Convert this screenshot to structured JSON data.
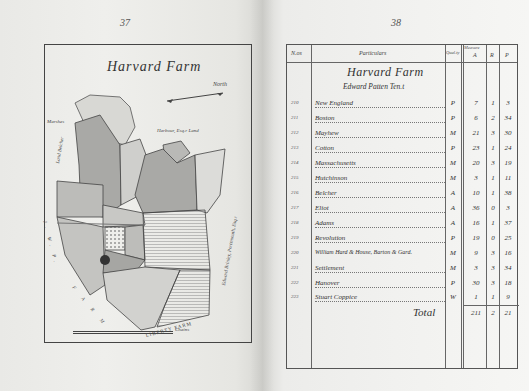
{
  "pages": {
    "left_number": "37",
    "right_number": "38"
  },
  "map": {
    "title": "Harvard Farm",
    "north_label": "North",
    "labels": {
      "top_right": "Harbour, Esq.r Land",
      "left_side": "Land Belcher",
      "left_vertical": "J. W. P.",
      "left_lower": "F A R M",
      "right_vertical": "Edward Brinley, Portsmouth, Esq.r",
      "bottom": "LIBERTY FARM",
      "far_left": "Marshes"
    },
    "scale_label": "Chains",
    "scale_ticks": [
      "0",
      "10",
      "20",
      "30"
    ]
  },
  "ledger": {
    "headers": {
      "no": "N.os",
      "particulars": "Particulars",
      "quality": "Qual.ty",
      "measure": "Measure",
      "a": "A",
      "r": "R",
      "p": "P"
    },
    "title": "Harvard Farm",
    "tenant": "Edward Patten Ten.t",
    "rows": [
      {
        "no": "210",
        "name": "New England",
        "q": "P",
        "a": "7",
        "r": "1",
        "p": "3"
      },
      {
        "no": "211",
        "name": "Boston",
        "q": "P",
        "a": "6",
        "r": "2",
        "p": "34"
      },
      {
        "no": "212",
        "name": "Mayhew",
        "q": "M",
        "a": "21",
        "r": "3",
        "p": "30"
      },
      {
        "no": "213",
        "name": "Cotton",
        "q": "P",
        "a": "23",
        "r": "1",
        "p": "24"
      },
      {
        "no": "214",
        "name": "Massachusetts",
        "q": "M",
        "a": "20",
        "r": "3",
        "p": "19"
      },
      {
        "no": "215",
        "name": "Hutchinson",
        "q": "M",
        "a": "3",
        "r": "1",
        "p": "11"
      },
      {
        "no": "216",
        "name": "Belcher",
        "q": "A",
        "a": "10",
        "r": "1",
        "p": "38"
      },
      {
        "no": "217",
        "name": "Eliot",
        "q": "A",
        "a": "36",
        "r": "0",
        "p": "3"
      },
      {
        "no": "218",
        "name": "Adams",
        "q": "A",
        "a": "16",
        "r": "1",
        "p": "37"
      },
      {
        "no": "219",
        "name": "Revolution",
        "q": "P",
        "a": "19",
        "r": "0",
        "p": "25"
      },
      {
        "no": "220",
        "name": "William Hard & House, Barton & Gard.",
        "q": "M",
        "a": "9",
        "r": "3",
        "p": "16"
      },
      {
        "no": "221",
        "name": "Settlement",
        "q": "M",
        "a": "3",
        "r": "3",
        "p": "34"
      },
      {
        "no": "222",
        "name": "Hanover",
        "q": "P",
        "a": "30",
        "r": "3",
        "p": "18"
      },
      {
        "no": "223",
        "name": "Stuart Coppice",
        "q": "W",
        "a": "1",
        "r": "1",
        "p": "9"
      }
    ],
    "total": {
      "label": "Total",
      "a": "211",
      "r": "2",
      "p": "21"
    }
  }
}
